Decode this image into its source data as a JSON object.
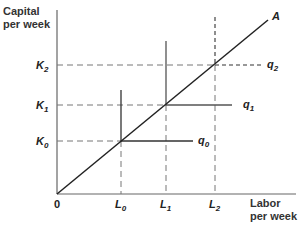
{
  "diagram": {
    "y_axis_title_line1": "Capital",
    "y_axis_title_line2": "per week",
    "x_axis_title_line1": "Labor",
    "x_axis_title_line2": "per week",
    "origin_label": "0",
    "ray_label": "A",
    "y_ticks": [
      {
        "base": "K",
        "sub": "2"
      },
      {
        "base": "K",
        "sub": "1"
      },
      {
        "base": "K",
        "sub": "0"
      }
    ],
    "x_ticks": [
      {
        "base": "L",
        "sub": "0"
      },
      {
        "base": "L",
        "sub": "1"
      },
      {
        "base": "L",
        "sub": "2"
      }
    ],
    "isoquants": [
      {
        "base": "q",
        "sub": "0",
        "style": "solid"
      },
      {
        "base": "q",
        "sub": "1",
        "style": "solid"
      },
      {
        "base": "q",
        "sub": "2",
        "style": "dashed"
      }
    ],
    "colors": {
      "axis": "#555555",
      "ray": "#222222",
      "isoquant": "#333333",
      "guide": "#777777"
    }
  }
}
